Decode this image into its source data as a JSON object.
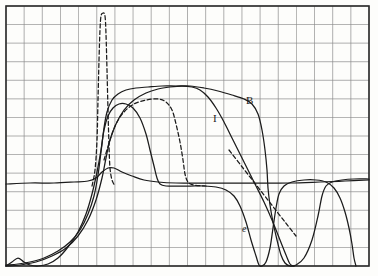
{
  "figure": {
    "background_color": "#fdfdfb",
    "grid_color": "#8a8a8a",
    "border_color": "#2b2b2b",
    "curve_color": "#1b1b1b"
  },
  "annotations": [
    {
      "name": "curve-label-b",
      "text": "B",
      "x": 246,
      "y": 95
    },
    {
      "name": "curve-label-i",
      "text": "I",
      "x": 213,
      "y": 113
    },
    {
      "name": "curve-label-e",
      "text": "e",
      "x": 242,
      "y": 224
    }
  ],
  "chart_data": {
    "type": "line",
    "title": "",
    "xlabel": "",
    "ylabel": "",
    "grid": true,
    "legend": "inline-labels",
    "xlim": [
      0,
      20
    ],
    "ylim": [
      0,
      14
    ],
    "plot_box": {
      "left": 6,
      "top": 6,
      "right": 369,
      "bottom": 266,
      "cols": 20,
      "rows": 14,
      "cell_w": 18.15,
      "cell_h": 18.57
    },
    "series": [
      {
        "name": "B",
        "label": "B",
        "style": "solid",
        "description": "Broad plateau curve rising from baseline near left, flat top, steep fall on right then recovering to a high shoulder",
        "points": [
          [
            6,
            265
          ],
          [
            18,
            264
          ],
          [
            30,
            262
          ],
          [
            44,
            258
          ],
          [
            58,
            251
          ],
          [
            70,
            242
          ],
          [
            80,
            230
          ],
          [
            88,
            214
          ],
          [
            94,
            196
          ],
          [
            98,
            175
          ],
          [
            101,
            152
          ],
          [
            104,
            128
          ],
          [
            107,
            112
          ],
          [
            112,
            100
          ],
          [
            118,
            94
          ],
          [
            126,
            90
          ],
          [
            136,
            88
          ],
          [
            148,
            87
          ],
          [
            162,
            86
          ],
          [
            176,
            86
          ],
          [
            190,
            86
          ],
          [
            204,
            88
          ],
          [
            218,
            91
          ],
          [
            232,
            95
          ],
          [
            244,
            99
          ],
          [
            252,
            104
          ],
          [
            258,
            114
          ],
          [
            262,
            130
          ],
          [
            265,
            150
          ],
          [
            267,
            170
          ],
          [
            268,
            188
          ],
          [
            270,
            205
          ],
          [
            273,
            222
          ],
          [
            277,
            240
          ],
          [
            281,
            255
          ],
          [
            285,
            263
          ],
          [
            290,
            266
          ],
          [
            296,
            265
          ],
          [
            304,
            258
          ],
          [
            312,
            240
          ],
          [
            318,
            216
          ],
          [
            322,
            196
          ],
          [
            326,
            186
          ],
          [
            332,
            182
          ],
          [
            342,
            180
          ],
          [
            354,
            179
          ],
          [
            369,
            179
          ]
        ]
      },
      {
        "name": "I",
        "label": "I",
        "style": "solid",
        "description": "Plateau curve with rounded top peaking mid-plot, steeper decline than B, reaching bottom near x=290",
        "points": [
          [
            6,
            266
          ],
          [
            20,
            265
          ],
          [
            36,
            262
          ],
          [
            52,
            256
          ],
          [
            66,
            248
          ],
          [
            78,
            236
          ],
          [
            88,
            220
          ],
          [
            96,
            200
          ],
          [
            102,
            178
          ],
          [
            106,
            158
          ],
          [
            110,
            140
          ],
          [
            116,
            124
          ],
          [
            124,
            110
          ],
          [
            134,
            100
          ],
          [
            146,
            93
          ],
          [
            158,
            89
          ],
          [
            170,
            87
          ],
          [
            182,
            86
          ],
          [
            192,
            87
          ],
          [
            200,
            90
          ],
          [
            208,
            97
          ],
          [
            216,
            108
          ],
          [
            224,
            122
          ],
          [
            232,
            138
          ],
          [
            240,
            154
          ],
          [
            248,
            170
          ],
          [
            256,
            186
          ],
          [
            264,
            202
          ],
          [
            272,
            220
          ],
          [
            280,
            240
          ],
          [
            286,
            255
          ],
          [
            290,
            264
          ],
          [
            294,
            266
          ]
        ]
      },
      {
        "name": "e",
        "label": "e",
        "style": "solid",
        "description": "Curve forming a high shoulder at left, near-flat mid baseline, then plunging to bottom around x=260 and recovering at far right",
        "points": [
          [
            6,
            266
          ],
          [
            12,
            262
          ],
          [
            18,
            258
          ],
          [
            24,
            262
          ],
          [
            30,
            265
          ],
          [
            38,
            266
          ],
          [
            48,
            264
          ],
          [
            58,
            258
          ],
          [
            68,
            247
          ],
          [
            78,
            232
          ],
          [
            86,
            214
          ],
          [
            92,
            194
          ],
          [
            97,
            172
          ],
          [
            101,
            150
          ],
          [
            104,
            130
          ],
          [
            108,
            116
          ],
          [
            113,
            108
          ],
          [
            119,
            104
          ],
          [
            126,
            104
          ],
          [
            133,
            108
          ],
          [
            140,
            118
          ],
          [
            146,
            134
          ],
          [
            150,
            150
          ],
          [
            154,
            166
          ],
          [
            157,
            178
          ],
          [
            160,
            184
          ],
          [
            166,
            186
          ],
          [
            176,
            186
          ],
          [
            190,
            186
          ],
          [
            204,
            186
          ],
          [
            216,
            187
          ],
          [
            226,
            190
          ],
          [
            234,
            196
          ],
          [
            240,
            206
          ],
          [
            246,
            222
          ],
          [
            251,
            240
          ],
          [
            256,
            256
          ],
          [
            259,
            265
          ],
          [
            262,
            266
          ],
          [
            266,
            262
          ],
          [
            270,
            248
          ],
          [
            273,
            228
          ],
          [
            276,
            208
          ],
          [
            279,
            194
          ],
          [
            284,
            186
          ],
          [
            292,
            182
          ],
          [
            304,
            180
          ],
          [
            316,
            180
          ],
          [
            326,
            182
          ],
          [
            334,
            188
          ],
          [
            340,
            198
          ],
          [
            345,
            212
          ],
          [
            349,
            228
          ],
          [
            352,
            244
          ],
          [
            354,
            258
          ],
          [
            356,
            266
          ]
        ]
      },
      {
        "name": "baseline",
        "label": "",
        "style": "solid",
        "description": "Near-horizontal low-amplitude trace across the whole plot at about y=182 with a small bump near the left peak",
        "points": [
          [
            6,
            184
          ],
          [
            30,
            183
          ],
          [
            54,
            183
          ],
          [
            74,
            182
          ],
          [
            88,
            181
          ],
          [
            96,
            178
          ],
          [
            102,
            172
          ],
          [
            108,
            168
          ],
          [
            114,
            168
          ],
          [
            122,
            172
          ],
          [
            132,
            176
          ],
          [
            144,
            180
          ],
          [
            158,
            182
          ],
          [
            176,
            183
          ],
          [
            200,
            183
          ],
          [
            230,
            183
          ],
          [
            260,
            183
          ],
          [
            290,
            183
          ],
          [
            320,
            182
          ],
          [
            345,
            181
          ],
          [
            369,
            180
          ]
        ]
      },
      {
        "name": "dashed-peak",
        "label": "",
        "style": "dashed",
        "description": "Narrow very tall dashed resonance peak near x=103 rising to the top of the frame, plus a dashed shoulder branch running right and a dashed diagonal on the right side",
        "points": [
          [
            92,
            186
          ],
          [
            95,
            170
          ],
          [
            97,
            140
          ],
          [
            98,
            100
          ],
          [
            99,
            60
          ],
          [
            100,
            30
          ],
          [
            101,
            16
          ],
          [
            103,
            13
          ],
          [
            105,
            16
          ],
          [
            106,
            34
          ],
          [
            107,
            70
          ],
          [
            108,
            110
          ],
          [
            109,
            146
          ],
          [
            110,
            168
          ],
          [
            112,
            180
          ],
          [
            115,
            186
          ]
        ]
      },
      {
        "name": "dashed-branch-left",
        "label": "",
        "style": "dashed",
        "description": "Dashed branch curving up-right from the peak base to a shoulder then decaying to the baseline",
        "points": [
          [
            104,
            160
          ],
          [
            110,
            140
          ],
          [
            116,
            124
          ],
          [
            124,
            112
          ],
          [
            134,
            104
          ],
          [
            146,
            100
          ],
          [
            158,
            99
          ],
          [
            166,
            102
          ],
          [
            172,
            110
          ],
          [
            176,
            124
          ],
          [
            180,
            142
          ],
          [
            183,
            160
          ],
          [
            185,
            174
          ],
          [
            188,
            182
          ],
          [
            194,
            185
          ],
          [
            206,
            186
          ]
        ]
      },
      {
        "name": "dashed-diagonal-right",
        "label": "",
        "style": "dashed",
        "description": "Straight dashed diagonal descending through the right crossing region",
        "points": [
          [
            229,
            150
          ],
          [
            243,
            168
          ],
          [
            257,
            186
          ],
          [
            271,
            204
          ],
          [
            285,
            222
          ],
          [
            296,
            236
          ]
        ]
      }
    ]
  }
}
